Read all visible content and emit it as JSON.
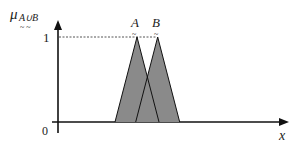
{
  "chart_data": {
    "type": "area",
    "title": "",
    "ylabel": "μ_{A∪B}",
    "ylabel_parts": {
      "mu": "μ",
      "subscript": "A∪B",
      "tilde": "~  ~"
    },
    "xlabel": "x",
    "yticks": [
      "0",
      "1"
    ],
    "ylim": [
      0,
      1
    ],
    "series": [
      {
        "name": "A",
        "tilde": "~",
        "points": [
          [
            0.0,
            0
          ],
          [
            0.5,
            1
          ],
          [
            1.0,
            0
          ]
        ]
      },
      {
        "name": "B",
        "tilde": "~",
        "points": [
          [
            0.47,
            0
          ],
          [
            0.97,
            1
          ],
          [
            1.47,
            0
          ]
        ]
      }
    ],
    "reference_line": {
      "y": 1,
      "style": "dashed"
    },
    "fill_color": "#8a8a8a",
    "line_color": "#111111"
  }
}
